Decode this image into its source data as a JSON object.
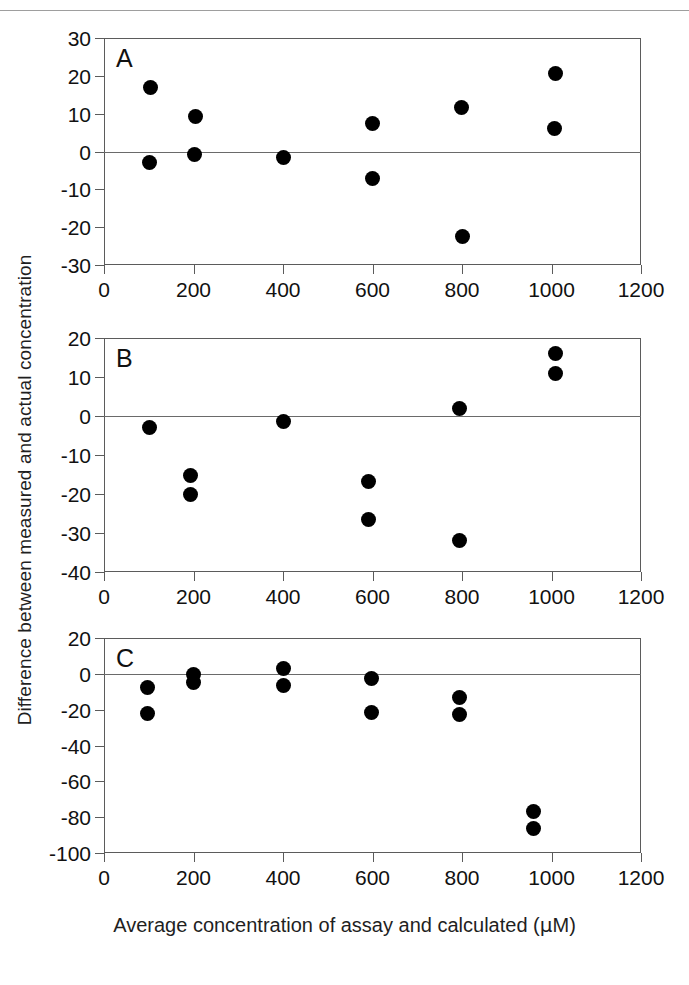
{
  "figure": {
    "x_axis_title": "Average concentration of assay and calculated (µM)",
    "y_axis_title": "Difference between measured and actual concentration",
    "x_ticks": [
      0,
      200,
      400,
      600,
      800,
      1000,
      1200
    ],
    "x_min": 0,
    "x_max": 1200,
    "marker_color": "#000000",
    "axis_color": "#5b5b5b",
    "zero_line_color": "#6a6a6a"
  },
  "chart_data": [
    {
      "type": "scatter",
      "panel": "A",
      "title": "",
      "xlabel": "Average concentration of assay and calculated (µM)",
      "ylabel": "Difference between measured and actual concentration",
      "xlim": [
        0,
        1200
      ],
      "ylim": [
        -30,
        30
      ],
      "xticks": [
        0,
        200,
        400,
        600,
        800,
        1000,
        1200
      ],
      "yticks": [
        30,
        20,
        10,
        0,
        -10,
        -20,
        -30
      ],
      "grid": false,
      "legend": "none",
      "reference_line": 0,
      "points": [
        {
          "x": 104,
          "y": 16.8
        },
        {
          "x": 102,
          "y": -2.9
        },
        {
          "x": 205,
          "y": 9.2
        },
        {
          "x": 203,
          "y": -0.7
        },
        {
          "x": 400,
          "y": -1.6
        },
        {
          "x": 601,
          "y": 7.5
        },
        {
          "x": 600,
          "y": -7.1
        },
        {
          "x": 798,
          "y": 11.7
        },
        {
          "x": 800,
          "y": -22.4
        },
        {
          "x": 1008,
          "y": 20.6
        },
        {
          "x": 1007,
          "y": 6.1
        }
      ]
    },
    {
      "type": "scatter",
      "panel": "B",
      "title": "",
      "xlabel": "Average concentration of assay and calculated (µM)",
      "ylabel": "Difference between measured and actual concentration",
      "xlim": [
        0,
        1200
      ],
      "ylim": [
        -40,
        20
      ],
      "xticks": [
        0,
        200,
        400,
        600,
        800,
        1000,
        1200
      ],
      "yticks": [
        20,
        10,
        0,
        -10,
        -20,
        -30,
        -40
      ],
      "grid": false,
      "legend": "none",
      "reference_line": 0,
      "points": [
        {
          "x": 102,
          "y": -3.0
        },
        {
          "x": 193,
          "y": -15.3
        },
        {
          "x": 193,
          "y": -20.2
        },
        {
          "x": 400,
          "y": -1.5
        },
        {
          "x": 592,
          "y": -16.8
        },
        {
          "x": 592,
          "y": -26.5
        },
        {
          "x": 795,
          "y": 1.9
        },
        {
          "x": 795,
          "y": -32.0
        },
        {
          "x": 1008,
          "y": 16.0
        },
        {
          "x": 1008,
          "y": 10.9
        }
      ]
    },
    {
      "type": "scatter",
      "panel": "C",
      "title": "",
      "xlabel": "Average concentration of assay and calculated (µM)",
      "ylabel": "Difference between measured and actual concentration",
      "xlim": [
        0,
        1200
      ],
      "ylim": [
        -100,
        20
      ],
      "xticks": [
        0,
        200,
        400,
        600,
        800,
        1000,
        1200
      ],
      "yticks": [
        20,
        0,
        -20,
        -40,
        -60,
        -80,
        -100
      ],
      "grid": false,
      "legend": "none",
      "reference_line": 0,
      "points": [
        {
          "x": 98,
          "y": -7.5
        },
        {
          "x": 98,
          "y": -22.3
        },
        {
          "x": 200,
          "y": -0.5
        },
        {
          "x": 200,
          "y": -5.0
        },
        {
          "x": 400,
          "y": 3.0
        },
        {
          "x": 400,
          "y": -6.4
        },
        {
          "x": 597,
          "y": -2.4
        },
        {
          "x": 597,
          "y": -21.8
        },
        {
          "x": 795,
          "y": -13.2
        },
        {
          "x": 795,
          "y": -22.7
        },
        {
          "x": 960,
          "y": -77.0
        },
        {
          "x": 960,
          "y": -86.5
        }
      ]
    }
  ],
  "panels": [
    {
      "letter": "A"
    },
    {
      "letter": "B"
    },
    {
      "letter": "C"
    }
  ]
}
